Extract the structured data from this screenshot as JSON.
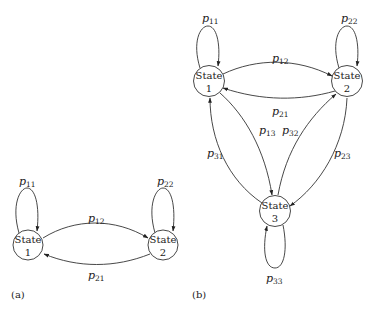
{
  "figure": {
    "panels": [
      {
        "label": "(a)",
        "states": [
          {
            "id": "1",
            "line1": "State",
            "line2": "1"
          },
          {
            "id": "2",
            "line1": "State",
            "line2": "2"
          }
        ],
        "transitions": [
          {
            "from": "1",
            "to": "1",
            "label": "p",
            "sub": "11"
          },
          {
            "from": "2",
            "to": "2",
            "label": "p",
            "sub": "22"
          },
          {
            "from": "1",
            "to": "2",
            "label": "p",
            "sub": "12"
          },
          {
            "from": "2",
            "to": "1",
            "label": "p",
            "sub": "21"
          }
        ]
      },
      {
        "label": "(b)",
        "states": [
          {
            "id": "1",
            "line1": "State",
            "line2": "1"
          },
          {
            "id": "2",
            "line1": "State",
            "line2": "2"
          },
          {
            "id": "3",
            "line1": "State",
            "line2": "3"
          }
        ],
        "transitions": [
          {
            "from": "1",
            "to": "1",
            "label": "p",
            "sub": "11"
          },
          {
            "from": "2",
            "to": "2",
            "label": "p",
            "sub": "22"
          },
          {
            "from": "3",
            "to": "3",
            "label": "p",
            "sub": "33"
          },
          {
            "from": "1",
            "to": "2",
            "label": "p",
            "sub": "12"
          },
          {
            "from": "2",
            "to": "1",
            "label": "p",
            "sub": "21"
          },
          {
            "from": "1",
            "to": "3",
            "label": "p",
            "sub": "13"
          },
          {
            "from": "3",
            "to": "2",
            "label": "p",
            "sub": "32"
          },
          {
            "from": "3",
            "to": "1",
            "label": "p",
            "sub": "31"
          },
          {
            "from": "2",
            "to": "3",
            "label": "p",
            "sub": "23"
          }
        ]
      }
    ]
  }
}
